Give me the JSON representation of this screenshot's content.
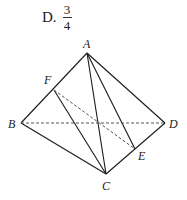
{
  "option": {
    "label": "D.",
    "numerator": "3",
    "denominator": "4"
  },
  "diagram": {
    "points": {
      "A": {
        "label": "A",
        "x": 87,
        "y": 53
      },
      "B": {
        "label": "B",
        "x": 21,
        "y": 123
      },
      "C": {
        "label": "C",
        "x": 106,
        "y": 174
      },
      "D": {
        "label": "D",
        "x": 165,
        "y": 123
      },
      "E": {
        "label": "E",
        "x": 135,
        "y": 149
      },
      "F": {
        "label": "F",
        "x": 54,
        "y": 90
      }
    },
    "solid_edges": [
      "AB",
      "AD",
      "AC",
      "AE",
      "BC",
      "CD",
      "FC"
    ],
    "dashed_edges": [
      "BD",
      "FE"
    ]
  }
}
